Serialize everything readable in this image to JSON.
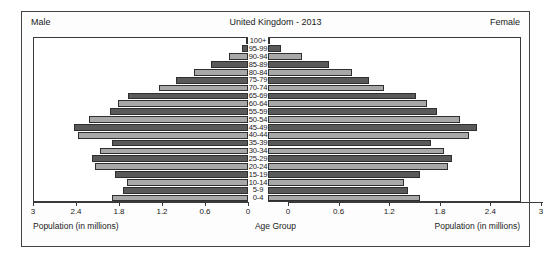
{
  "header": {
    "male_label": "Male",
    "female_label": "Female",
    "title": "United Kingdom - 2013"
  },
  "axis": {
    "male_title": "Population (in millions)",
    "female_title": "Population (in millions)",
    "center_title": "Age Group",
    "male_ticks": [
      "3",
      "2.4",
      "1.8",
      "1.2",
      "0.6",
      "0"
    ],
    "female_ticks": [
      "0",
      "0.6",
      "1.2",
      "1.8",
      "2.4",
      "3"
    ]
  },
  "colors": {
    "bar_dark": "#595959",
    "bar_light": "#a8a8a8",
    "bar_outline": "#2f2f2f",
    "frame": "#444444",
    "background": "#ffffff"
  },
  "chart_data": {
    "type": "bar",
    "title": "United Kingdom - 2013",
    "subtitle": "",
    "xlabel": "Population (in millions)",
    "ylabel": "Age Group",
    "xlim": [
      0,
      3
    ],
    "grid": false,
    "legend_position": "top-corners",
    "categories": [
      "100+",
      "95-99",
      "90-94",
      "85-89",
      "80-84",
      "75-79",
      "70-74",
      "65-69",
      "60-64",
      "55-59",
      "50-54",
      "45-49",
      "40-44",
      "35-39",
      "30-34",
      "25-29",
      "20-24",
      "15-19",
      "10-14",
      "5-9",
      "0-4"
    ],
    "series": [
      {
        "name": "Male",
        "side": "left",
        "values": [
          0.01,
          0.09,
          0.26,
          0.52,
          0.76,
          1.0,
          1.24,
          1.68,
          1.82,
          1.93,
          2.22,
          2.43,
          2.37,
          1.9,
          2.07,
          2.18,
          2.14,
          1.86,
          1.69,
          1.75,
          1.9
        ]
      },
      {
        "name": "Female",
        "side": "right",
        "values": [
          0.02,
          0.15,
          0.4,
          0.72,
          1.0,
          1.2,
          1.38,
          1.76,
          1.89,
          2.0,
          2.28,
          2.48,
          2.38,
          1.93,
          2.09,
          2.18,
          2.13,
          1.8,
          1.61,
          1.66,
          1.8
        ]
      }
    ]
  }
}
